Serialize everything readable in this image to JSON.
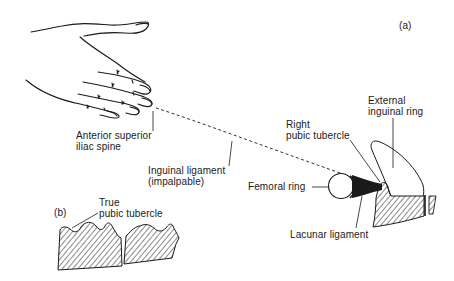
{
  "figure": {
    "panels": [
      {
        "id": "a",
        "label": "(a)"
      },
      {
        "id": "b",
        "label": "(b)"
      }
    ],
    "labels": {
      "asis": {
        "line1": "Anterior superior",
        "line2": "iliac spine"
      },
      "inguinal_ligament": {
        "line1": "Inguinal ligament",
        "line2": "(impalpable)"
      },
      "right_pubic_tubercle": {
        "line1": "Right",
        "line2": "pubic tubercle"
      },
      "external_inguinal_ring": {
        "line1": "External",
        "line2": "inguinal ring"
      },
      "femoral_ring": {
        "line1": "Femoral ring"
      },
      "lacunar_ligament": {
        "line1": "Lacunar ligament"
      },
      "true_pubic_tubercle": {
        "line1": "True",
        "line2": "pubic tubercle"
      }
    },
    "colors": {
      "ink": "#1a1a1a",
      "background": "#ffffff"
    }
  }
}
